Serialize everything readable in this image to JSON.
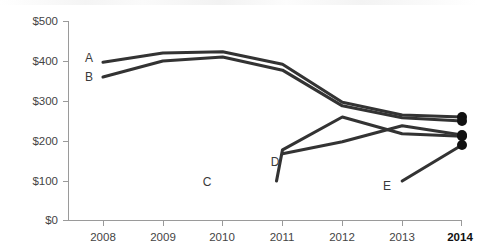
{
  "chart_data": {
    "type": "line",
    "title": "",
    "subtitle": "",
    "xlabel": "",
    "ylabel": "",
    "x": [
      2008,
      2009,
      2010,
      2011,
      2012,
      2013,
      2014
    ],
    "categories": [
      "2008",
      "2009",
      "2010",
      "2011",
      "2012",
      "2013",
      "2014"
    ],
    "xlim": [
      2008,
      2014
    ],
    "ylim": [
      0,
      500
    ],
    "ytick_values": [
      0,
      100,
      200,
      300,
      400,
      500
    ],
    "ytick_labels": [
      "$0",
      "$100",
      "$200",
      "$300",
      "$400",
      "$500"
    ],
    "grid": false,
    "legend": "inline-series-labels",
    "series": [
      {
        "name": "A",
        "label": "A",
        "color": "#333333",
        "x": [
          2008,
          2009,
          2010,
          2011,
          2012,
          2013,
          2014
        ],
        "values": [
          397,
          420,
          423,
          392,
          297,
          265,
          260
        ],
        "end_marker": true,
        "end_value": 260
      },
      {
        "name": "B",
        "label": "B",
        "color": "#333333",
        "x": [
          2008,
          2009,
          2010,
          2011,
          2012,
          2013,
          2014
        ],
        "values": [
          360,
          400,
          410,
          377,
          288,
          258,
          250
        ],
        "end_marker": true,
        "end_value": 250
      },
      {
        "name": "C",
        "label": "C",
        "color": "#333333",
        "x": [
          2011,
          2012,
          2013,
          2014
        ],
        "values": [
          178,
          260,
          218,
          212
        ],
        "start_x": 2010.9,
        "start_value": 100,
        "end_marker": true,
        "end_value": 212
      },
      {
        "name": "D",
        "label": "D",
        "color": "#333333",
        "x": [
          2011,
          2012,
          2013,
          2014
        ],
        "values": [
          168,
          198,
          238,
          215
        ],
        "end_marker": true,
        "end_value": 215
      },
      {
        "name": "E",
        "label": "E",
        "color": "#333333",
        "x": [
          2013,
          2014
        ],
        "values": [
          100,
          190
        ],
        "end_marker": true,
        "end_value": 190
      }
    ],
    "series_label_positions": [
      {
        "name": "A",
        "label": "A",
        "x_px": 89,
        "y_px": 62
      },
      {
        "name": "B",
        "label": "B",
        "x_px": 89,
        "y_px": 81
      },
      {
        "name": "C",
        "label": "C",
        "x_px": 207,
        "y_px": 186
      },
      {
        "name": "D",
        "label": "D",
        "x_px": 275,
        "y_px": 166
      },
      {
        "name": "E",
        "label": "E",
        "x_px": 387,
        "y_px": 190
      }
    ],
    "axis": {
      "y_axis_x_px": 68,
      "x_axis_y_px": 221,
      "plot_right_px": 462,
      "plot_top_px": 21,
      "year_tick_x_px": [
        103,
        163,
        222,
        282,
        342,
        402,
        462
      ]
    }
  },
  "axis_labels": {
    "y": [
      "$500",
      "$400",
      "$300",
      "$200",
      "$100",
      "$0"
    ],
    "x": [
      "2008",
      "2009",
      "2010",
      "2011",
      "2012",
      "2013",
      "2014"
    ]
  },
  "series_labels": [
    "A",
    "B",
    "C",
    "D",
    "E"
  ]
}
